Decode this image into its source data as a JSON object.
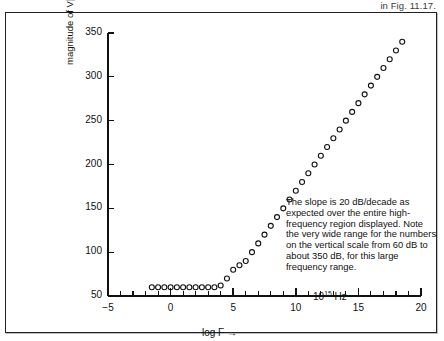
{
  "page": {
    "running_head": "in Fig. 11.17."
  },
  "chart_data": {
    "type": "scatter",
    "title": "",
    "xlabel": "log F →",
    "ylabel": "magnitude of V[·] in dB",
    "xlim": [
      -5,
      20
    ],
    "ylim": [
      50,
      350
    ],
    "x_ticks": [
      -5,
      0,
      5,
      10,
      15,
      20
    ],
    "x_tick_labels": [
      "−5",
      "0",
      "5",
      "10",
      "15",
      "20"
    ],
    "x_minor_step": 1,
    "y_ticks": [
      50,
      100,
      150,
      200,
      250,
      300,
      350
    ],
    "y_tick_labels": [
      "50",
      "100",
      "150",
      "200",
      "250",
      "300",
      "350"
    ],
    "grid": false,
    "legend": null,
    "marker": "open-circle",
    "x": [
      -1.5,
      -1.0,
      -0.5,
      0.0,
      0.5,
      1.0,
      1.5,
      2.0,
      2.5,
      3.0,
      3.5,
      4.0,
      4.5,
      5.0,
      5.5,
      6.0,
      6.5,
      7.0,
      7.5,
      8.0,
      8.5,
      9.0,
      9.5,
      10.0,
      10.5,
      11.0,
      11.5,
      12.0,
      12.5,
      13.0,
      13.5,
      14.0,
      14.5,
      15.0,
      15.5,
      16.0,
      16.5,
      17.0,
      17.5,
      18.0,
      18.5
    ],
    "y": [
      60,
      60,
      60,
      60,
      60,
      60,
      60,
      60,
      60,
      60,
      60,
      62,
      70,
      80,
      85,
      90,
      100,
      110,
      120,
      130,
      140,
      150,
      160,
      170,
      180,
      190,
      200,
      210,
      220,
      230,
      240,
      250,
      260,
      270,
      280,
      290,
      300,
      310,
      320,
      330,
      340
    ],
    "annotations": [
      {
        "name": "slope-note",
        "text": "The slope is 20 dB/decade as expected over the entire high-frequency region displayed. Note the very wide range for the numbers on the vertical scale from 60 dB to about 350 dB, for this large frequency range."
      },
      {
        "name": "hz-marker",
        "text": "10",
        "exponent": "15",
        "unit": "Hz"
      }
    ]
  },
  "colors": {
    "ink": "#111111",
    "frame": "#222222",
    "paper": "#ffffff"
  }
}
